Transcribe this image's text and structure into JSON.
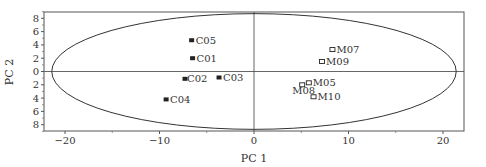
{
  "chart_data": {
    "type": "scatter",
    "title": "",
    "xlabel": "PC 1",
    "ylabel": "PC 2",
    "xlim": [
      -23,
      22.5
    ],
    "ylim": [
      -9,
      9
    ],
    "xticks": [
      -20,
      -10,
      0,
      10,
      20
    ],
    "xtick_labels": [
      "−20",
      "−10",
      "0",
      "10",
      "20"
    ],
    "yticks": [
      8,
      6,
      4,
      2,
      0,
      -2,
      -4,
      -6,
      -8
    ],
    "ytick_labels": [
      "8",
      "6",
      "4",
      "2",
      "0",
      "2",
      "4",
      "6",
      "8"
    ],
    "grid": false,
    "legend": null,
    "reference_lines": {
      "x0": true,
      "y0": true
    },
    "confidence_ellipse": {
      "cx": 0,
      "cy": 0,
      "rx": 21.4,
      "ry": 8.7
    },
    "series": [
      {
        "name": "C",
        "marker": "filled-square",
        "color": "#222222",
        "points": [
          {
            "label": "C05",
            "x": -6.6,
            "y": 4.7
          },
          {
            "label": "C01",
            "x": -6.5,
            "y": 2.0
          },
          {
            "label": "C02",
            "x": -7.3,
            "y": -1.1
          },
          {
            "label": "C03",
            "x": -3.7,
            "y": -0.9
          },
          {
            "label": "C04",
            "x": -9.3,
            "y": -4.2
          }
        ]
      },
      {
        "name": "M",
        "marker": "open-square",
        "color": "#222222",
        "points": [
          {
            "label": "M07",
            "x": 8.3,
            "y": 3.3
          },
          {
            "label": "M09",
            "x": 7.2,
            "y": 1.5
          },
          {
            "label": "M05",
            "x": 5.8,
            "y": -1.7
          },
          {
            "label": "M08",
            "x": 5.1,
            "y": -2.0
          },
          {
            "label": "M10",
            "x": 6.3,
            "y": -3.8
          }
        ]
      }
    ]
  }
}
